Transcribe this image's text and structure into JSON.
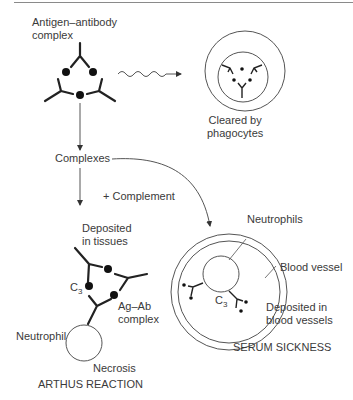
{
  "figure": {
    "labels": {
      "antigen_antibody_complex": "Antigen–antibody\ncomplex",
      "cleared_by_phagocytes": "Cleared by\nphagocytes",
      "complexes": "Complexes",
      "plus_complement": "+ Complement",
      "deposited_in_tissues": "Deposited\nin tissues",
      "c3_left": "C",
      "c3_left_sub": "3",
      "ag_ab_complex": "Ag–Ab\ncomplex",
      "neutrophil": "Neutrophil",
      "necrosis": "Necrosis",
      "arthus_reaction": "ARTHUS REACTION",
      "neutrophils": "Neutrophils",
      "blood_vessel": "Blood vessel",
      "c3_right": "C",
      "c3_right_sub": "3",
      "deposited_in_blood_vessels": "Deposited in\nblood vessels",
      "serum_sickness": "SERUM SICKNESS"
    },
    "colors": {
      "line": "#2a2a2a",
      "thin_line": "#555555",
      "text": "#3a3a3a"
    }
  }
}
